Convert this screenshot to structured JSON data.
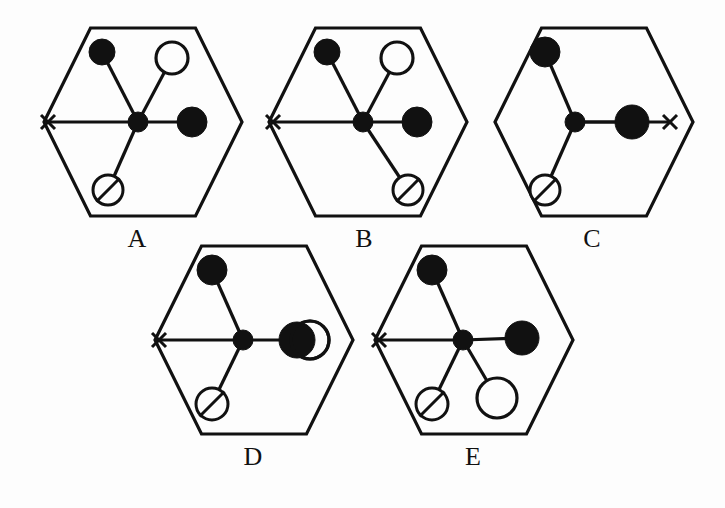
{
  "figure": {
    "type": "multiple-choice-diagram",
    "background_color": "#fdfdfd",
    "ink_color": "#111111",
    "panel_count": 5,
    "panels": [
      {
        "id": "A",
        "label": "A",
        "label_x": 137,
        "label_y": 247,
        "hexagon": {
          "cx": 143,
          "cy": 122,
          "rx": 99,
          "ry": 94
        },
        "hub": {
          "x": 138,
          "y": 122,
          "r": 10,
          "style": "filled"
        },
        "x_mark": {
          "x": 48,
          "y": 122,
          "size": 7,
          "side": "left"
        },
        "nodes": [
          {
            "name": "upper-left-filled-circle",
            "x": 102,
            "y": 52,
            "r": 13,
            "style": "filled"
          },
          {
            "name": "upper-right-open-circle",
            "x": 172,
            "y": 58,
            "r": 16,
            "style": "open"
          },
          {
            "name": "right-filled-circle",
            "x": 192,
            "y": 122,
            "r": 15,
            "style": "filled"
          },
          {
            "name": "lower-left-slashed-circle",
            "x": 108,
            "y": 190,
            "r": 15,
            "style": "slashed"
          }
        ],
        "edges": [
          {
            "from": "hub",
            "to": "upper-left-filled-circle"
          },
          {
            "from": "hub",
            "to": "upper-right-open-circle"
          },
          {
            "from": "hub",
            "to": "right-filled-circle"
          },
          {
            "from": "hub",
            "to": "lower-left-slashed-circle"
          },
          {
            "from": "hub",
            "to": "x-mark"
          }
        ]
      },
      {
        "id": "B",
        "label": "B",
        "label_x": 364,
        "label_y": 247,
        "hexagon": {
          "cx": 368,
          "cy": 122,
          "rx": 99,
          "ry": 94
        },
        "hub": {
          "x": 363,
          "y": 122,
          "r": 10,
          "style": "filled"
        },
        "x_mark": {
          "x": 273,
          "y": 122,
          "size": 7,
          "side": "left"
        },
        "nodes": [
          {
            "name": "upper-left-filled-circle",
            "x": 327,
            "y": 52,
            "r": 13,
            "style": "filled"
          },
          {
            "name": "upper-right-open-circle",
            "x": 397,
            "y": 58,
            "r": 16,
            "style": "open"
          },
          {
            "name": "right-filled-circle",
            "x": 417,
            "y": 122,
            "r": 15,
            "style": "filled"
          },
          {
            "name": "lower-right-slashed-circle",
            "x": 408,
            "y": 190,
            "r": 15,
            "style": "slashed"
          }
        ],
        "edges": [
          {
            "from": "hub",
            "to": "upper-left-filled-circle"
          },
          {
            "from": "hub",
            "to": "upper-right-open-circle"
          },
          {
            "from": "hub",
            "to": "right-filled-circle"
          },
          {
            "from": "hub",
            "to": "lower-right-slashed-circle"
          },
          {
            "from": "hub",
            "to": "x-mark"
          }
        ]
      },
      {
        "id": "C",
        "label": "C",
        "label_x": 592,
        "label_y": 247,
        "hexagon": {
          "cx": 594,
          "cy": 122,
          "rx": 99,
          "ry": 94
        },
        "hub": {
          "x": 575,
          "y": 122,
          "r": 10,
          "style": "filled"
        },
        "x_mark": {
          "x": 670,
          "y": 122,
          "size": 7,
          "side": "right"
        },
        "nodes": [
          {
            "name": "upper-left-filled-circle",
            "x": 545,
            "y": 52,
            "r": 15,
            "style": "filled"
          },
          {
            "name": "right-filled-circle",
            "x": 632,
            "y": 122,
            "r": 17,
            "style": "filled"
          },
          {
            "name": "lower-left-slashed-circle",
            "x": 545,
            "y": 190,
            "r": 15,
            "style": "slashed"
          }
        ],
        "edges": [
          {
            "from": "hub",
            "to": "upper-left-filled-circle"
          },
          {
            "from": "hub",
            "to": "right-filled-circle"
          },
          {
            "from": "hub",
            "to": "lower-left-slashed-circle"
          },
          {
            "from": "hub",
            "to": "x-mark"
          }
        ]
      },
      {
        "id": "D",
        "label": "D",
        "label_x": 253,
        "label_y": 465,
        "hexagon": {
          "cx": 254,
          "cy": 340,
          "rx": 99,
          "ry": 94
        },
        "hub": {
          "x": 243,
          "y": 340,
          "r": 10,
          "style": "filled"
        },
        "x_mark": {
          "x": 159,
          "y": 340,
          "size": 7,
          "side": "left"
        },
        "nodes": [
          {
            "name": "upper-left-filled-circle",
            "x": 212,
            "y": 270,
            "r": 15,
            "style": "filled"
          },
          {
            "name": "right-open-circle",
            "x": 310,
            "y": 340,
            "r": 19,
            "style": "open"
          },
          {
            "name": "right-filled-circle",
            "x": 297,
            "y": 340,
            "r": 18,
            "style": "filled"
          },
          {
            "name": "lower-left-slashed-circle",
            "x": 212,
            "y": 404,
            "r": 16,
            "style": "slashed"
          }
        ],
        "edges": [
          {
            "from": "hub",
            "to": "upper-left-filled-circle"
          },
          {
            "from": "hub",
            "to": "right-filled-circle"
          },
          {
            "from": "hub",
            "to": "lower-left-slashed-circle"
          },
          {
            "from": "hub",
            "to": "x-mark"
          }
        ]
      },
      {
        "id": "E",
        "label": "E",
        "label_x": 473,
        "label_y": 465,
        "hexagon": {
          "cx": 474,
          "cy": 340,
          "rx": 99,
          "ry": 94
        },
        "hub": {
          "x": 463,
          "y": 340,
          "r": 10,
          "style": "filled"
        },
        "x_mark": {
          "x": 379,
          "y": 340,
          "size": 7,
          "side": "left"
        },
        "nodes": [
          {
            "name": "upper-left-filled-circle",
            "x": 432,
            "y": 270,
            "r": 15,
            "style": "filled"
          },
          {
            "name": "right-filled-circle",
            "x": 522,
            "y": 338,
            "r": 17,
            "style": "filled"
          },
          {
            "name": "lower-right-open-circle",
            "x": 497,
            "y": 398,
            "r": 20,
            "style": "open"
          },
          {
            "name": "lower-left-slashed-circle",
            "x": 432,
            "y": 404,
            "r": 16,
            "style": "slashed"
          }
        ],
        "edges": [
          {
            "from": "hub",
            "to": "upper-left-filled-circle"
          },
          {
            "from": "hub",
            "to": "right-filled-circle"
          },
          {
            "from": "hub",
            "to": "lower-right-open-circle"
          },
          {
            "from": "hub",
            "to": "lower-left-slashed-circle"
          },
          {
            "from": "hub",
            "to": "x-mark"
          }
        ]
      }
    ]
  }
}
